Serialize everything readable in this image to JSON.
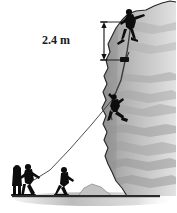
{
  "figure": {
    "name": "rock-climbing-physics-diagram",
    "background_color": "#ffffff"
  },
  "annotation": {
    "measurement_label": "2.4 m",
    "value": 2.4,
    "unit": "m",
    "line_color": "#111111",
    "orientation": "vertical",
    "arrowheads": "both-ends"
  },
  "cliff": {
    "label": "cliff-rock-face",
    "fill_light": "#d2d2d2",
    "fill_mid": "#b8b8b8",
    "fill_dark": "#9a9a9a",
    "outline_color": "#2a2a2a"
  },
  "ground": {
    "label": "ground-line",
    "line_color": "#2b2b2b",
    "shadow_color": "#c9c9c9"
  },
  "rope": {
    "label": "climbing-rope",
    "color": "#3a3a3a"
  },
  "figures": [
    {
      "id": "top-climber",
      "label": "climber-at-cliff-top",
      "color": "#0d0d0d"
    },
    {
      "id": "hanging-climber",
      "label": "climber-hanging-on-rope",
      "color": "#0d0d0d"
    },
    {
      "id": "ground-person-1",
      "label": "person-with-backpack",
      "color": "#0d0d0d"
    },
    {
      "id": "ground-person-2",
      "label": "belayer-pulling-rope",
      "color": "#0d0d0d"
    },
    {
      "id": "ground-person-3",
      "label": "person-walking-right",
      "color": "#0d0d0d"
    }
  ],
  "gear": {
    "label": "anchor-gear-block",
    "color": "#111111"
  }
}
